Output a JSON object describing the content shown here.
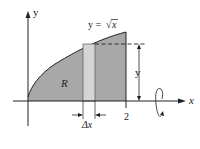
{
  "figure": {
    "axes": {
      "x_label": "x",
      "y_label": "y"
    },
    "curve": {
      "equation_label": "y = √x",
      "equation_lhs": "y =",
      "equation_sqrt": "√",
      "equation_arg": "x"
    },
    "region_label": "R",
    "tick_label_x": "2",
    "strip_width_label": "Δx",
    "height_label": "y",
    "colors": {
      "region_fill": "#a8a8a8",
      "strip_fill": "#d4d4d4",
      "line": "#222222"
    }
  }
}
